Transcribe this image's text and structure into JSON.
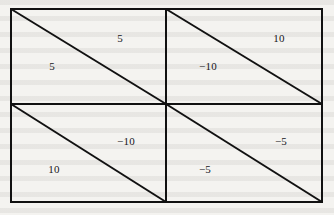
{
  "figure": {
    "type": "geometric-diagram",
    "stroke_color": "#111111",
    "background_color": "#f4f3f0",
    "text_color": "#17161a",
    "outer_border": {
      "x": 11,
      "y": 9,
      "width": 311,
      "height": 193
    },
    "grid": {
      "rows": 2,
      "columns": 2,
      "vertical_divider_x": 166,
      "horizontal_divider_y": 104
    },
    "cells": [
      {
        "id": "cell-top-left",
        "row": 0,
        "column": 0,
        "x": 11,
        "y": 9,
        "width": 155,
        "height": 95,
        "diagonal": "top-left-to-bottom-right",
        "upper_triangle": {
          "value": "5",
          "label_x": 120,
          "label_y": 38
        },
        "lower_triangle": {
          "value": "5",
          "label_x": 52,
          "label_y": 66
        }
      },
      {
        "id": "cell-top-right",
        "row": 0,
        "column": 1,
        "x": 166,
        "y": 9,
        "width": 156,
        "height": 95,
        "diagonal": "top-left-to-bottom-right",
        "upper_triangle": {
          "value": "10",
          "label_x": 279,
          "label_y": 38
        },
        "lower_triangle": {
          "value": "−10",
          "label_x": 208,
          "label_y": 66
        }
      },
      {
        "id": "cell-bottom-left",
        "row": 1,
        "column": 0,
        "x": 11,
        "y": 104,
        "width": 155,
        "height": 98,
        "diagonal": "top-left-to-bottom-right",
        "upper_triangle": {
          "value": "−10",
          "label_x": 126,
          "label_y": 141
        },
        "lower_triangle": {
          "value": "10",
          "label_x": 54,
          "label_y": 169
        }
      },
      {
        "id": "cell-bottom-right",
        "row": 1,
        "column": 1,
        "x": 166,
        "y": 104,
        "width": 156,
        "height": 98,
        "diagonal": "top-left-to-bottom-right",
        "upper_triangle": {
          "value": "−5",
          "label_x": 281,
          "label_y": 141
        },
        "lower_triangle": {
          "value": "−5",
          "label_x": 205,
          "label_y": 169
        }
      }
    ]
  }
}
